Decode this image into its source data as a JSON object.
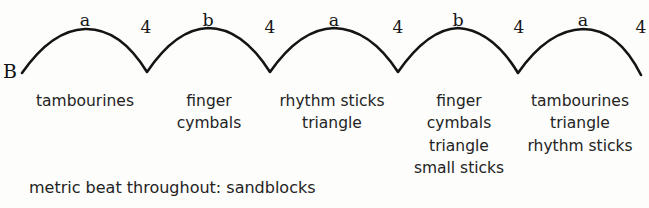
{
  "diagram": {
    "type": "musical-phrase-arc-diagram",
    "section_label": "B",
    "stroke_color": "#141414",
    "background_color": "#fdfdfc",
    "baseline_y": 73,
    "peak_y": 29,
    "start_x": 22,
    "end_x": 641,
    "arcs": [
      {
        "phrase_letter": "a",
        "peak_x": 85,
        "start_x": 22,
        "end_x": 147,
        "count_label": "4",
        "count_x": 146
      },
      {
        "phrase_letter": "b",
        "peak_x": 208,
        "start_x": 147,
        "end_x": 270,
        "count_label": "4",
        "count_x": 270
      },
      {
        "phrase_letter": "a",
        "peak_x": 334,
        "start_x": 270,
        "end_x": 398,
        "count_label": "4",
        "count_x": 398
      },
      {
        "phrase_letter": "b",
        "peak_x": 458,
        "start_x": 398,
        "end_x": 518,
        "count_label": "4",
        "count_x": 519
      },
      {
        "phrase_letter": "a",
        "peak_x": 583,
        "start_x": 518,
        "end_x": 641,
        "count_label": "4",
        "count_x": 641
      }
    ],
    "instrument_groups": [
      {
        "center_x": 85,
        "lines": [
          "tambourines"
        ]
      },
      {
        "center_x": 209,
        "lines": [
          "finger",
          "cymbals"
        ]
      },
      {
        "center_x": 332,
        "lines": [
          "rhythm sticks",
          "triangle"
        ]
      },
      {
        "center_x": 459,
        "lines": [
          "finger",
          "cymbals",
          "triangle",
          "small sticks"
        ]
      },
      {
        "center_x": 580,
        "lines": [
          "tambourines",
          "triangle",
          "rhythm sticks"
        ]
      }
    ],
    "footer_note": "metric beat throughout: sandblocks"
  }
}
